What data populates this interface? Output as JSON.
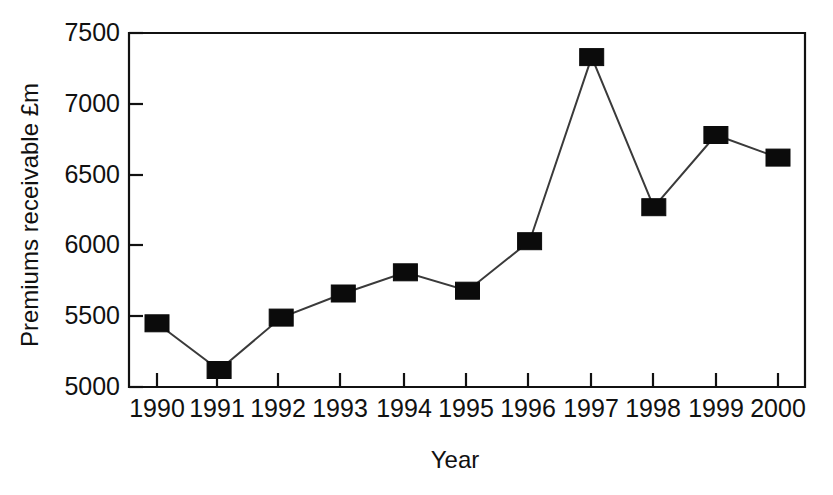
{
  "chart_data": {
    "type": "line",
    "title": "",
    "xlabel": "Year",
    "ylabel": "Premiums receivable £m",
    "categories": [
      "1990",
      "1991",
      "1992",
      "1993",
      "1994",
      "1995",
      "1996",
      "1997",
      "1998",
      "1999",
      "2000"
    ],
    "values": [
      5450,
      5120,
      5490,
      5660,
      5810,
      5680,
      6030,
      7330,
      6270,
      6780,
      6620
    ],
    "series": [
      {
        "name": "Premiums receivable",
        "values": [
          5450,
          5120,
          5490,
          5660,
          5810,
          5680,
          6030,
          7330,
          6270,
          6780,
          6620
        ]
      }
    ],
    "ylim": [
      5000,
      7500
    ],
    "yticks": [
      5000,
      5500,
      6000,
      6500,
      7000,
      7500
    ],
    "ytick_labels": [
      "5000",
      "5500",
      "6000",
      "6500",
      "7000",
      "7500"
    ],
    "xtick_labels": [
      "1990",
      "1991",
      "1992",
      "1993",
      "1994",
      "1995",
      "1996",
      "1997",
      "1998",
      "1999",
      "2000"
    ],
    "grid": false,
    "legend": false,
    "legend_position": "none",
    "marker": "filled-square",
    "marker_color": "#0b0b0b",
    "line_color": "#3a3a3a",
    "axis_color": "#111111",
    "background_color": "#ffffff"
  },
  "axes": {
    "y_axis_title": "Premiums receivable £m",
    "x_axis_title": "Year",
    "y_tick_labels": [
      "7500",
      "7000",
      "6500",
      "6000",
      "5500",
      "5000"
    ],
    "x_tick_labels": [
      "1990",
      "1991",
      "1992",
      "1993",
      "1994",
      "1995",
      "1996",
      "1997",
      "1998",
      "1999",
      "2000"
    ]
  }
}
